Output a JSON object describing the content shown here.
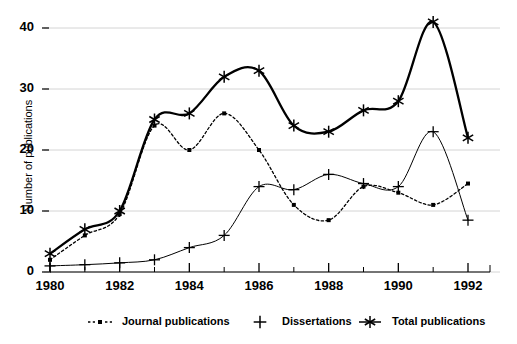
{
  "chart_data": {
    "type": "line",
    "title": "",
    "xlabel": "",
    "ylabel": "Number of publications",
    "x": [
      1980,
      1981,
      1982,
      1983,
      1984,
      1985,
      1986,
      1987,
      1988,
      1989,
      1990,
      1991,
      1992
    ],
    "xlim": [
      1980,
      1992
    ],
    "ylim": [
      0,
      42
    ],
    "grid": true,
    "legend_position": "bottom",
    "xticks": [
      "1980",
      "1982",
      "1984",
      "1986",
      "1988",
      "1990",
      "1992"
    ],
    "xticks_minor": [
      "1981",
      "1983",
      "1985",
      "1987",
      "1989",
      "1991"
    ],
    "yticks": [
      "0",
      "10",
      "20",
      "30",
      "40"
    ],
    "series": [
      {
        "name": "Journal publications",
        "marker": "square",
        "linestyle": "dotted",
        "values": [
          2,
          6,
          9.5,
          24,
          20,
          26,
          20,
          11,
          8.5,
          14,
          13,
          11,
          14.5
        ]
      },
      {
        "name": "Dissertations",
        "marker": "plus",
        "linestyle": "solid-thin",
        "values": [
          1,
          1.2,
          1.5,
          2,
          4,
          6,
          14,
          13.5,
          16,
          14.5,
          14,
          23,
          8.5
        ]
      },
      {
        "name": "Total publications",
        "marker": "asterisk",
        "linestyle": "solid-thick",
        "values": [
          3,
          7,
          10,
          25,
          26,
          32,
          33,
          24,
          23,
          26.5,
          28,
          41,
          22
        ]
      }
    ]
  },
  "legend": {
    "entries": [
      {
        "label": "Journal publications",
        "marker": "square-dotted"
      },
      {
        "label": "Dissertations",
        "marker": "plus"
      },
      {
        "label": "Total publications",
        "marker": "asterisk"
      }
    ]
  }
}
